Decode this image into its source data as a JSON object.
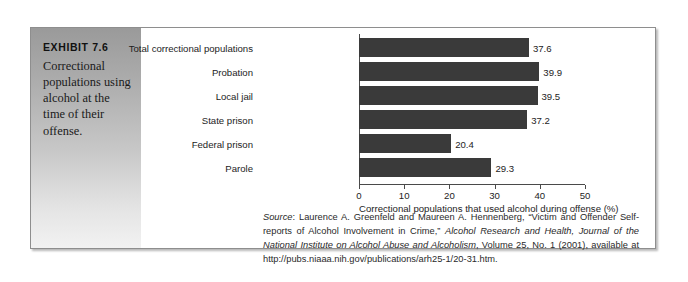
{
  "exhibit": {
    "label": "EXHIBIT 7.6",
    "caption": "Correctional populations using alcohol at the time of their offense."
  },
  "source": {
    "lead_italic": "Source",
    "text_1": ": Laurence A. Greenfeld and Maureen A. Hennenberg, “Victim and Offender Self-reports of Alcohol Involvement in Crime,” ",
    "italic_1": "Alcohol Research and Health, Journal of the National Institute on Alcohol Abuse and Alcoholism",
    "text_2": ", Volume 25, No. 1 (2001), available at http://pubs.niaaa.nih.gov/publications/arh25-1/20-31.htm."
  },
  "colors": {
    "bar": "#3a3a3a",
    "axis": "#4a4a4a",
    "panel_top": "#9a9a9a",
    "panel_bottom": "#f2f2f2",
    "frame_border": "#8e8e8e"
  },
  "chart_data": {
    "type": "bar",
    "orientation": "horizontal",
    "title": "",
    "categories": [
      "Total correctional populations",
      "Probation",
      "Local jail",
      "State prison",
      "Federal prison",
      "Parole"
    ],
    "values": [
      37.6,
      39.9,
      39.5,
      37.2,
      20.4,
      29.3
    ],
    "value_labels": [
      "37.6",
      "39.9",
      "39.5",
      "37.2",
      "20.4",
      "29.3"
    ],
    "xlabel": "Correctional populations that used alcohol during offense (%)",
    "ylabel": "",
    "xlim": [
      0,
      50
    ],
    "xticks": [
      0,
      10,
      20,
      30,
      40,
      50
    ],
    "xtick_labels": [
      "0",
      "10",
      "20",
      "30",
      "40",
      "50"
    ],
    "grid": false,
    "legend": false
  }
}
